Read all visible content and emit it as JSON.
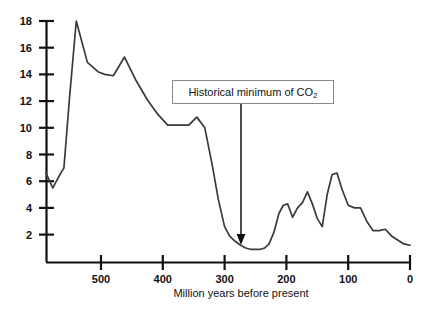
{
  "chart_data": {
    "type": "line",
    "title": "",
    "xlabel": "Million years before present",
    "ylabel": "",
    "xlim": [
      589,
      0
    ],
    "ylim": [
      0,
      18.6
    ],
    "x_ticks": [
      500,
      400,
      300,
      200,
      100,
      0
    ],
    "x_tick_labels": [
      "500",
      "400",
      "300",
      "200",
      "100",
      "0"
    ],
    "y_ticks": [
      2,
      4,
      6,
      8,
      10,
      12,
      14,
      16,
      18
    ],
    "y_tick_labels": [
      "2",
      "4",
      "6",
      "8",
      "10",
      "12",
      "14",
      "16",
      "18"
    ],
    "x_axis_inverted": true,
    "grid": false,
    "legend": null,
    "series": [
      {
        "name": "CO2 relative to present",
        "color": "#3a3a3a",
        "x": [
          589,
          578,
          570,
          560,
          551,
          540,
          522,
          505,
          494,
          480,
          462,
          444,
          425,
          408,
          392,
          375,
          358,
          345,
          332,
          320,
          310,
          300,
          292,
          283,
          274,
          266,
          258,
          250,
          242,
          235,
          228,
          220,
          212,
          205,
          198,
          190,
          182,
          174,
          166,
          158,
          150,
          142,
          134,
          126,
          118,
          110,
          100,
          90,
          80,
          70,
          60,
          50,
          40,
          30,
          20,
          10,
          0
        ],
        "y": [
          6.6,
          5.5,
          6.2,
          7.0,
          12.2,
          18.0,
          14.9,
          14.2,
          14.0,
          13.9,
          15.3,
          13.6,
          12.1,
          11.0,
          10.2,
          10.2,
          10.2,
          10.8,
          10.0,
          7.2,
          4.6,
          2.6,
          1.9,
          1.5,
          1.2,
          1.0,
          0.9,
          0.9,
          0.9,
          1.0,
          1.3,
          2.2,
          3.6,
          4.2,
          4.3,
          3.3,
          4.0,
          4.4,
          5.2,
          4.3,
          3.2,
          2.6,
          5.0,
          6.5,
          6.6,
          5.4,
          4.2,
          4.0,
          4.0,
          3.0,
          2.3,
          2.3,
          2.4,
          1.9,
          1.6,
          1.3,
          1.2
        ]
      }
    ],
    "annotations": [
      {
        "name": "historical-minimum-callout",
        "text_prefix": "Historical minimum of CO",
        "text_subscript": "2",
        "points_to_x": 270,
        "points_to_y": 1.0,
        "boxed": true
      }
    ]
  },
  "axis": {
    "x_title": "Million years before present"
  }
}
